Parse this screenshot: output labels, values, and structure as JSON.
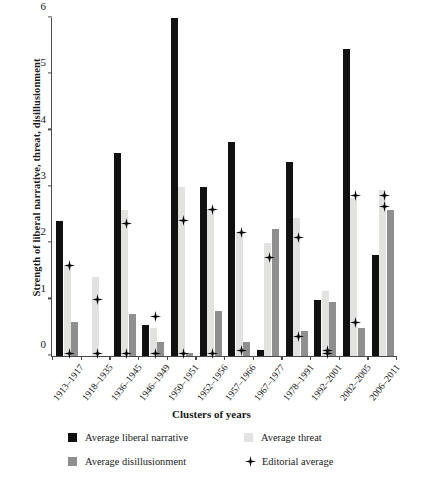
{
  "chart_data": {
    "type": "bar",
    "title": "",
    "xlabel": "Clusters of years",
    "ylabel": "Strength of liberal narrative, threat, disillusionment",
    "ylim": [
      0,
      6
    ],
    "yticks": [
      0,
      1,
      2,
      3,
      4,
      5,
      6
    ],
    "grid": false,
    "legend_position": "bottom",
    "categories": [
      "1913–1917",
      "1918–1935",
      "1936–1945",
      "1946–1949",
      "1950–1951",
      "1952–1956",
      "1957–1966",
      "1967–1977",
      "1978–1991",
      "1992–2001",
      "2002–2005",
      "2006–2011"
    ],
    "series": [
      {
        "name": "Average liberal narrative",
        "type": "bar",
        "color": "#111111",
        "values": [
          2.4,
          0,
          3.6,
          0.55,
          6.0,
          3.0,
          3.8,
          0.1,
          3.45,
          1.0,
          5.45,
          1.8
        ]
      },
      {
        "name": "Average threat",
        "type": "bar",
        "color": "#e2e2e0",
        "values": [
          1.6,
          1.4,
          2.6,
          0.5,
          3.0,
          2.6,
          2.2,
          2.0,
          2.45,
          1.15,
          2.8,
          2.95
        ]
      },
      {
        "name": "Average disillusionment",
        "type": "bar",
        "color": "#8f8f8f",
        "values": [
          0.6,
          0,
          0.75,
          0.25,
          0.05,
          0.8,
          0.25,
          2.25,
          0.45,
          0.95,
          0.5,
          2.6
        ]
      },
      {
        "name": "Editorial average",
        "type": "marker",
        "color": "#000000",
        "marker": "plus-star",
        "values": [
          [
            0.05,
            1.6
          ],
          [
            0.05,
            1.0
          ],
          [
            0.05,
            2.35
          ],
          [
            0.05,
            0.7
          ],
          [
            0.05,
            2.4
          ],
          [
            0.05,
            2.6
          ],
          [
            0.1,
            2.2
          ],
          [
            1.75
          ],
          [
            0.35,
            2.1
          ],
          [
            0.05,
            0.1
          ],
          [
            0.6,
            2.85
          ],
          [
            2.65,
            2.85
          ]
        ]
      }
    ]
  },
  "legend": {
    "items": [
      {
        "label": "Average liberal narrative",
        "swatch": "narrative-swatch"
      },
      {
        "label": "Average threat",
        "swatch": "threat-swatch"
      },
      {
        "label": "Average disillusionment",
        "swatch": "disillusionment-swatch"
      },
      {
        "label": "Editorial average",
        "swatch": "editorial-marker-icon"
      }
    ]
  }
}
